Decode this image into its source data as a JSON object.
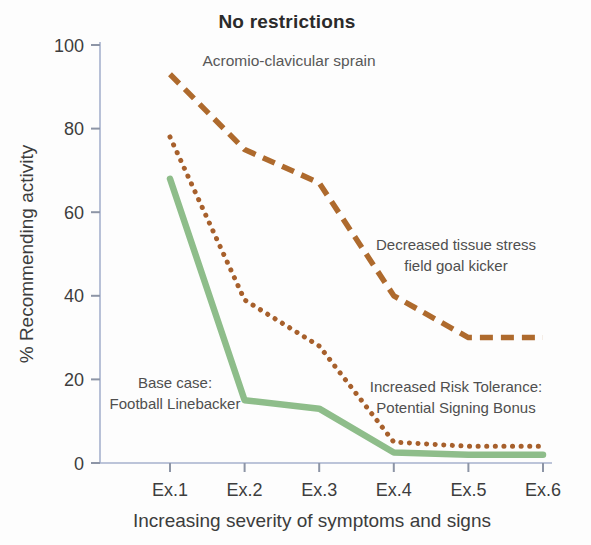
{
  "chart_data": {
    "type": "line",
    "title": "No restrictions",
    "subtitle": "Acromio-clavicular sprain",
    "xlabel": "Increasing severity of symptoms and signs",
    "ylabel": "% Recommending activity",
    "categories": [
      "Ex.1",
      "Ex.2",
      "Ex.3",
      "Ex.4",
      "Ex.5",
      "Ex.6"
    ],
    "ylim": [
      0,
      100
    ],
    "yticks": [
      0,
      20,
      40,
      60,
      80,
      100
    ],
    "grid": false,
    "legend_position": "none",
    "series": [
      {
        "name": "Acromio-clavicular sprain (no restrictions)",
        "style": "dashed",
        "color": "#ae6a2d",
        "values": [
          93,
          75,
          67,
          40,
          30,
          30
        ]
      },
      {
        "name": "Increased Risk Tolerance: Potential Signing Bonus",
        "style": "dotted",
        "color": "#a7602c",
        "values": [
          78,
          39,
          28,
          5,
          4,
          4
        ]
      },
      {
        "name": "Base case: Football Linebacker",
        "style": "solid",
        "color": "#8ebd8a",
        "values": [
          68,
          15,
          13,
          2.5,
          2,
          2
        ]
      }
    ],
    "annotations": {
      "dashed": {
        "line1": "Decreased tissue stress",
        "line2": "field goal kicker"
      },
      "solid": {
        "line1": "Base case:",
        "line2": "Football Linebacker"
      },
      "dotted": {
        "line1": "Increased Risk Tolerance:",
        "line2": "Potential Signing Bonus"
      }
    },
    "axis_color": "#a6b1cd",
    "tick_color": "#8d95a6"
  }
}
